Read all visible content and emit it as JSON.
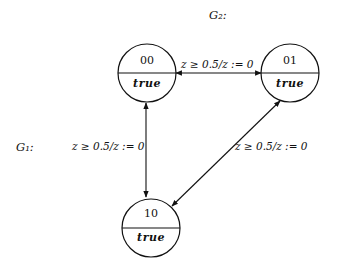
{
  "diagram": {
    "type": "timed-automaton",
    "labels": {
      "g2": "G₂:",
      "g1": "G₁:"
    },
    "states": [
      {
        "id": "00",
        "name": "00",
        "invariant": "true"
      },
      {
        "id": "01",
        "name": "01",
        "invariant": "true"
      },
      {
        "id": "10",
        "name": "10",
        "invariant": "true"
      }
    ],
    "edges": [
      {
        "from": "00",
        "to": "01",
        "bidirectional": true,
        "label": "z ≥ 0.5/z := 0"
      },
      {
        "from": "00",
        "to": "10",
        "bidirectional": true,
        "label": "z ≥ 0.5/z := 0"
      },
      {
        "from": "01",
        "to": "10",
        "bidirectional": true,
        "label": "z ≥ 0.5/z := 0"
      }
    ]
  }
}
